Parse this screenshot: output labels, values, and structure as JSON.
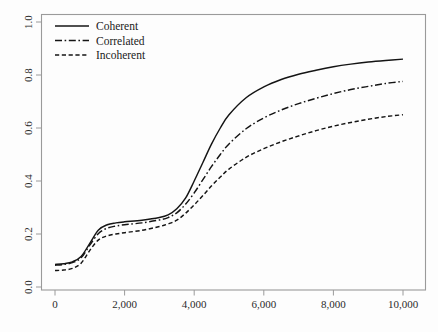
{
  "chart_data": {
    "type": "line",
    "title": "",
    "subtitle": "",
    "xlabel": "",
    "ylabel": "",
    "xlim": [
      0,
      10000
    ],
    "ylim": [
      0.0,
      1.0
    ],
    "grid": false,
    "legend_position": "top-left",
    "xticks": [
      0,
      2000,
      4000,
      6000,
      8000,
      10000
    ],
    "xtick_labels": [
      "0",
      "2,000",
      "4,000",
      "6,000",
      "8,000",
      "10,000"
    ],
    "yticks": [
      0.0,
      0.2,
      0.4,
      0.6,
      0.8,
      1.0
    ],
    "ytick_labels": [
      "0.0",
      "0.2",
      "0.4",
      "0.6",
      "0.8",
      "1.0"
    ],
    "x": [
      0,
      250,
      500,
      750,
      1000,
      1250,
      1500,
      1750,
      2000,
      2500,
      3000,
      3250,
      3500,
      3750,
      4000,
      4250,
      4500,
      4750,
      5000,
      5500,
      6000,
      6500,
      7000,
      7500,
      8000,
      8500,
      9000,
      9500,
      10000
    ],
    "series": [
      {
        "name": "Coherent",
        "style": "solid",
        "dasharray": "none",
        "color": "#141414",
        "values": [
          0.085,
          0.088,
          0.095,
          0.115,
          0.165,
          0.215,
          0.235,
          0.242,
          0.246,
          0.252,
          0.262,
          0.272,
          0.295,
          0.335,
          0.4,
          0.47,
          0.54,
          0.6,
          0.65,
          0.715,
          0.755,
          0.783,
          0.803,
          0.818,
          0.831,
          0.841,
          0.849,
          0.855,
          0.86
        ]
      },
      {
        "name": "Correlated",
        "style": "dash-dot",
        "dasharray": "7 2.6 1.6 2.6",
        "color": "#141414",
        "values": [
          0.082,
          0.085,
          0.092,
          0.11,
          0.158,
          0.202,
          0.222,
          0.23,
          0.235,
          0.242,
          0.253,
          0.262,
          0.28,
          0.312,
          0.355,
          0.405,
          0.455,
          0.5,
          0.54,
          0.598,
          0.638,
          0.668,
          0.692,
          0.712,
          0.73,
          0.745,
          0.757,
          0.768,
          0.776
        ]
      },
      {
        "name": "Incoherent",
        "style": "dashed",
        "dasharray": "4.2 2.6",
        "color": "#141414",
        "values": [
          0.062,
          0.064,
          0.07,
          0.09,
          0.138,
          0.178,
          0.193,
          0.2,
          0.205,
          0.214,
          0.228,
          0.238,
          0.252,
          0.278,
          0.31,
          0.345,
          0.382,
          0.415,
          0.445,
          0.49,
          0.522,
          0.548,
          0.57,
          0.59,
          0.607,
          0.621,
          0.633,
          0.643,
          0.65
        ]
      }
    ]
  },
  "legend": {
    "entries": [
      {
        "label": "Coherent"
      },
      {
        "label": "Correlated"
      },
      {
        "label": "Incoherent"
      }
    ]
  },
  "colors": {
    "line": "#141414",
    "axis": "#9a9a9a",
    "background": "#fdfdfd",
    "text": "#1a1a1a"
  }
}
